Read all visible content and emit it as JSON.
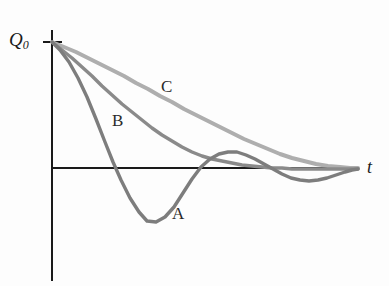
{
  "figure": {
    "background_color": "#fdfdfd",
    "axis_color": "#1a1a1a"
  },
  "labels": {
    "y_axis": "Q",
    "y_axis_subscript": "0",
    "x_axis": "t",
    "curve_a": "A",
    "curve_b": "B",
    "curve_c": "C"
  },
  "chart_data": {
    "type": "line",
    "title": "",
    "xlabel": "t",
    "ylabel": "Q0",
    "grid": false,
    "legend": "inline-curve-labels",
    "axis_origin_px": [
      52,
      168
    ],
    "q0_level_px": 42,
    "x_axis_end_px": 358,
    "y_axis_top_px": 30,
    "y_axis_bottom_px": 281,
    "xlim": [
      0,
      1
    ],
    "ylim": [
      -0.55,
      1.0
    ],
    "series": [
      {
        "name": "A",
        "label": "A",
        "regime": "underdamped",
        "color": "#7d7d7d",
        "linewidth": 3.4,
        "points": [
          [
            52,
            42
          ],
          [
            60,
            50
          ],
          [
            69,
            62
          ],
          [
            78,
            78
          ],
          [
            87,
            97
          ],
          [
            96,
            119
          ],
          [
            105,
            142
          ],
          [
            113,
            162
          ],
          [
            121,
            180
          ],
          [
            130,
            198
          ],
          [
            139,
            212
          ],
          [
            147,
            221
          ],
          [
            156,
            222
          ],
          [
            165,
            217
          ],
          [
            174,
            207
          ],
          [
            183,
            193
          ],
          [
            192,
            179
          ],
          [
            201,
            167
          ],
          [
            210,
            159
          ],
          [
            219,
            154
          ],
          [
            228,
            152
          ],
          [
            237,
            152
          ],
          [
            246,
            155
          ],
          [
            255,
            159
          ],
          [
            264,
            164
          ],
          [
            273,
            169
          ],
          [
            282,
            174
          ],
          [
            291,
            178
          ],
          [
            300,
            180
          ],
          [
            309,
            181
          ],
          [
            318,
            180
          ],
          [
            327,
            178
          ],
          [
            336,
            175
          ],
          [
            345,
            172
          ],
          [
            352,
            170
          ],
          [
            358,
            169
          ]
        ],
        "zero_crossings_px": [
          110,
          213,
          281
        ],
        "minimum_px": [
          151,
          222
        ],
        "overshoot_peak_px": [
          232,
          152
        ]
      },
      {
        "name": "B",
        "label": "B",
        "regime": "critically damped",
        "color": "#8a8a8a",
        "linewidth": 3.4,
        "points": [
          [
            52,
            42
          ],
          [
            62,
            50
          ],
          [
            72,
            58
          ],
          [
            82,
            67
          ],
          [
            92,
            76
          ],
          [
            102,
            86
          ],
          [
            112,
            95
          ],
          [
            122,
            104
          ],
          [
            132,
            112
          ],
          [
            142,
            120
          ],
          [
            152,
            128
          ],
          [
            162,
            135
          ],
          [
            172,
            141
          ],
          [
            182,
            147
          ],
          [
            192,
            152
          ],
          [
            202,
            156
          ],
          [
            212,
            159
          ],
          [
            222,
            161
          ],
          [
            232,
            163
          ],
          [
            242,
            165
          ],
          [
            252,
            166
          ],
          [
            262,
            167
          ],
          [
            272,
            168
          ],
          [
            282,
            168
          ],
          [
            292,
            169
          ],
          [
            302,
            169
          ],
          [
            312,
            169
          ],
          [
            322,
            169
          ],
          [
            332,
            169
          ],
          [
            342,
            169
          ],
          [
            352,
            169
          ],
          [
            358,
            169
          ]
        ]
      },
      {
        "name": "C",
        "label": "C",
        "regime": "overdamped",
        "color": "#aeaeae",
        "linewidth": 4.0,
        "points": [
          [
            52,
            42
          ],
          [
            64,
            47
          ],
          [
            76,
            52
          ],
          [
            88,
            58
          ],
          [
            100,
            64
          ],
          [
            112,
            70
          ],
          [
            124,
            76
          ],
          [
            136,
            83
          ],
          [
            148,
            89
          ],
          [
            160,
            96
          ],
          [
            172,
            102
          ],
          [
            184,
            109
          ],
          [
            196,
            115
          ],
          [
            208,
            121
          ],
          [
            220,
            127
          ],
          [
            232,
            133
          ],
          [
            244,
            139
          ],
          [
            256,
            144
          ],
          [
            268,
            149
          ],
          [
            280,
            154
          ],
          [
            292,
            158
          ],
          [
            304,
            161
          ],
          [
            316,
            164
          ],
          [
            328,
            166
          ],
          [
            340,
            167
          ],
          [
            350,
            168
          ],
          [
            358,
            168
          ]
        ]
      }
    ]
  }
}
